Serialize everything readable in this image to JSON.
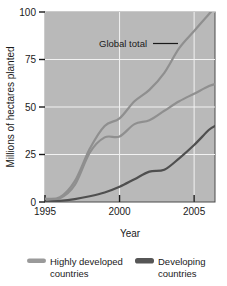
{
  "chart_data": {
    "type": "line",
    "title": "",
    "xlabel": "Year",
    "ylabel": "Millions of hectares planted",
    "xlim": [
      1995,
      2006.4
    ],
    "ylim": [
      0,
      100
    ],
    "xticks": [
      1995,
      2000,
      2005
    ],
    "xtick_labels": [
      "1995",
      "2000",
      "2005"
    ],
    "yticks": [
      0,
      25,
      50,
      75,
      100
    ],
    "ytick_labels": [
      "0",
      "25",
      "50",
      "75",
      "100"
    ],
    "grid": "white gridlines at x ticks and y ticks",
    "plot_background": "#b9b9b9",
    "legend_position": "below plot",
    "annotations": [
      {
        "text": "Global total",
        "x": 2001.5,
        "y": 86,
        "leader_to_x": 2004.0,
        "leader_to_y": 86
      }
    ],
    "x": [
      1995,
      1996,
      1997,
      1998,
      1999,
      2000,
      2001,
      2002,
      2003,
      2004,
      2005,
      2006,
      2006.4
    ],
    "series": [
      {
        "name": "Global total",
        "color": "#8f8f8f",
        "values": [
          1.7,
          2.5,
          11,
          28,
          40,
          44,
          53,
          59,
          68,
          81,
          90,
          99,
          102
        ]
      },
      {
        "name": "Highly developed countries",
        "color": "#8f8f8f",
        "values": [
          1.7,
          2.0,
          9,
          26,
          34,
          34.5,
          41,
          43,
          48,
          53,
          57,
          61,
          62
        ]
      },
      {
        "name": "Developing countries",
        "color": "#4f4f4f",
        "values": [
          0.2,
          0.6,
          1.5,
          3,
          5,
          8,
          12,
          16,
          17,
          23,
          30,
          38,
          40
        ]
      }
    ]
  },
  "legend": {
    "entries": [
      {
        "label_line1": "Highly developed",
        "label_line2": "countries",
        "color": "#9a9a9a"
      },
      {
        "label_line1": "Developing",
        "label_line2": "countries",
        "color": "#565656"
      }
    ]
  }
}
